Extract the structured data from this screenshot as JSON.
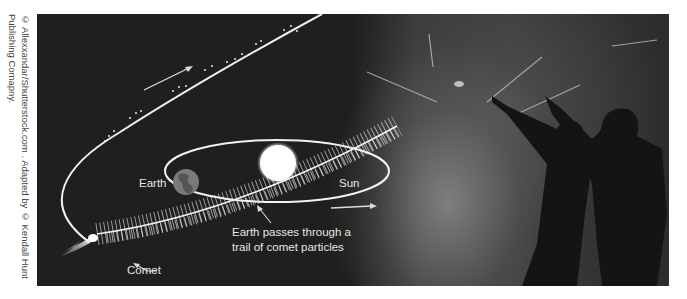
{
  "credit": {
    "text": "© Allexxandar/Shutterstock.com . Adapted by © Kendall Hunt Publishing Comapny."
  },
  "diagram": {
    "labels": {
      "earth": "Earth",
      "sun": "Sun",
      "comet": "Comet",
      "annotation_line1": "Earth passes through a",
      "annotation_line2": "trail of comet particles"
    },
    "colors": {
      "background": "#1c1c1c",
      "orbit_line": "#f2f2f2",
      "sun": "#ffffff",
      "earth": "#7a7a7a",
      "text": "#e6e6e6"
    }
  }
}
